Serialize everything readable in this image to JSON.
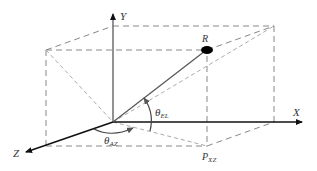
{
  "diagram": {
    "type": "3d-coordinate-geometry",
    "labels": {
      "x_axis": "X",
      "y_axis": "Y",
      "z_axis": "Z",
      "point_r": "R",
      "projection": "P",
      "projection_sub": "XZ",
      "elevation": "θ",
      "elevation_sub": "EL",
      "azimuth": "θ",
      "azimuth_sub": "AZ"
    },
    "colors": {
      "axis": "#111111",
      "dashed_box": "#888888",
      "light_dashed": "#aaaaaa",
      "vector": "#555555",
      "arc": "#444444",
      "point": "#000000"
    }
  }
}
